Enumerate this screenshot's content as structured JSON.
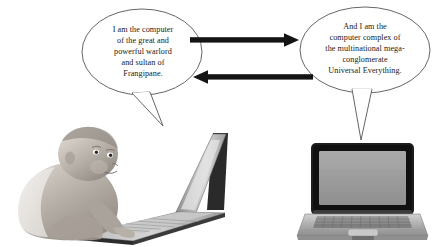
{
  "scene": {
    "title": "Two computers boasting about their owners",
    "background_color": "#ffffff",
    "width": 439,
    "height": 247
  },
  "speech_bubbles": [
    {
      "id": "left",
      "speaker": "baby-with-laptop",
      "text": "I am the computer\nof the great and\npowerful warlord\nand sultan of\nFrangipane.",
      "outline_color": "#555555",
      "fill_color": "#ffffff",
      "text_color": "#1a1a1a"
    },
    {
      "id": "right",
      "speaker": "desktop-laptop",
      "text": "And I am the\ncomputer complex of\nthe multinational mega-\nconglomerate\nUniversal Everything.",
      "outline_color": "#555555",
      "fill_color": "#ffffff",
      "text_color": "#1a1a1a"
    }
  ],
  "arrows": [
    {
      "id": "arrow-right",
      "direction": "right",
      "color": "#141414"
    },
    {
      "id": "arrow-left",
      "direction": "left",
      "color": "#141414"
    }
  ],
  "figures": [
    {
      "id": "baby-laptop-photo",
      "label": "Baby crawling and typing on an open laptop",
      "style": "grayscale photograph"
    },
    {
      "id": "laptop-photo",
      "label": "Open silver laptop facing forward",
      "style": "grayscale photograph"
    }
  ],
  "colors": {
    "ink": "#141414",
    "outline": "#555555",
    "screen_gray": "#9a9a9a",
    "bezel_dark": "#1d1d1d",
    "chassis_gray": "#b4b4b4",
    "skin_gray": "#b9b3ad"
  }
}
